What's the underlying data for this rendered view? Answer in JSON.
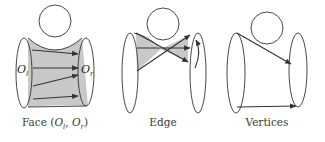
{
  "panels": [
    {
      "id": "face",
      "caption": "Face (Oₗ, Oᵣ)",
      "caption_parts": {
        "prefix": "Face (",
        "o1": "O",
        "s1": "l",
        "sep": ", ",
        "o2": "O",
        "s2": "r",
        "suffix": ")"
      },
      "labels": {
        "left": {
          "base": "O",
          "sub": "l"
        },
        "right": {
          "base": "O",
          "sub": "r"
        }
      },
      "arrow_count": 4,
      "shaded": "full-surface"
    },
    {
      "id": "edge",
      "caption": "Edge",
      "arrow_count": 3,
      "shaded": "bowtie",
      "rotation_arrow": true
    },
    {
      "id": "vertices",
      "caption": "Vertices",
      "arrow_count": 2,
      "shaded": "none"
    }
  ],
  "colors": {
    "stroke": "#333333",
    "shade": "#c8c8c8",
    "background": "#ffffff"
  }
}
